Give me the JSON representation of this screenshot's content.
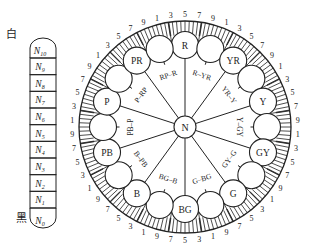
{
  "value_scale": {
    "top_label": "白",
    "bottom_label": "黑",
    "levels": [
      "N10",
      "N9",
      "N8",
      "N7",
      "N6",
      "N5",
      "N4",
      "N3",
      "N2",
      "N1",
      "N0"
    ]
  },
  "hue_wheel": {
    "center_label": "N",
    "main_hues": [
      "R",
      "YR",
      "Y",
      "GY",
      "G",
      "BG",
      "B",
      "PB",
      "P",
      "PR"
    ],
    "intermediate_labels": [
      "R–YR",
      "YR–Y",
      "Y–GY",
      "GY–G",
      "G–BG",
      "BG–B",
      "B–PB",
      "PB–P",
      "P–RP",
      "RP–R"
    ],
    "scale_numbers": [
      "1",
      "3",
      "5",
      "7",
      "9"
    ],
    "colors": {
      "line": "#222222",
      "background": "#ffffff"
    }
  }
}
